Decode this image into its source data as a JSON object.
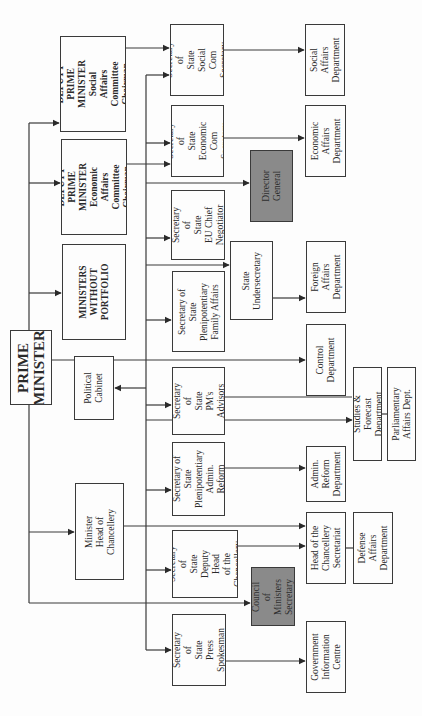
{
  "diagram": {
    "orientation": "rotated 90° counter-clockwise",
    "nodes": [
      {
        "id": "pm",
        "label": "PRIME\nMINISTER",
        "style": "bold-large",
        "box": [
          10,
          330,
          42,
          75
        ]
      },
      {
        "id": "dpm_social",
        "label": "DEPUTY PRIME\nMINISTER\nSocial Affairs\nCommittee\nChairman",
        "style": "bold",
        "box": [
          60,
          36,
          66,
          96
        ]
      },
      {
        "id": "dpm_econ",
        "label": "DEPUTY PRIME\nMINISTER\nEconomic Affairs\nCommittee\nChairman",
        "style": "bold",
        "box": [
          61,
          139,
          66,
          96
        ]
      },
      {
        "id": "mwp",
        "label": "MINISTERS\nWITHOUT\nPORTFOLIO",
        "style": "bold",
        "box": [
          62,
          244,
          64,
          96
        ]
      },
      {
        "id": "political_cabinet",
        "label": "Political\nCabinet",
        "style": "normal",
        "box": [
          74,
          356,
          40,
          64
        ]
      },
      {
        "id": "min_chancellery",
        "label": "Minister\nHead of Chancellery",
        "style": "normal",
        "box": [
          75,
          483,
          49,
          97
        ]
      },
      {
        "id": "sos_social",
        "label": "Secretary of\nState\nSocial Com\nSecretary",
        "style": "normal",
        "box": [
          170,
          24,
          54,
          72
        ]
      },
      {
        "id": "sos_econ",
        "label": "Secretary of\nState\nEconomic\nCom Secretary",
        "style": "normal",
        "box": [
          171,
          105,
          53,
          72
        ]
      },
      {
        "id": "sos_eu",
        "label": "Secretary of\nState\nEU Chief\nNegotiator",
        "style": "normal",
        "box": [
          171,
          190,
          54,
          70
        ]
      },
      {
        "id": "sos_family",
        "label": "Secretary of State\nPlenipotentiary\nFamily Affairs",
        "style": "normal",
        "box": [
          172,
          271,
          53,
          81
        ]
      },
      {
        "id": "sos_pm_advisors",
        "label": "Secretary of\nState\nPM's\nAdvisors",
        "style": "normal",
        "box": [
          172,
          367,
          53,
          68
        ]
      },
      {
        "id": "sos_admin",
        "label": "Secretary of\nState\nPlenipotentiary\nAdmin. Reform",
        "style": "normal",
        "box": [
          172,
          442,
          53,
          74
        ]
      },
      {
        "id": "sos_deputy_head",
        "label": "Secretary of\nState\nDeputy Head\nof the\nChancellery",
        "style": "normal",
        "box": [
          172,
          530,
          66,
          68
        ]
      },
      {
        "id": "sos_press",
        "label": "Secretary of\nState\nPress\nSpokesman",
        "style": "normal",
        "box": [
          172,
          614,
          54,
          72
        ]
      },
      {
        "id": "director_general",
        "label": "Director\nGeneral",
        "style": "shaded",
        "box": [
          250,
          150,
          43,
          72
        ]
      },
      {
        "id": "state_undersecretary",
        "label": "State\nUndersecretary",
        "style": "normal",
        "box": [
          230,
          241,
          43,
          79
        ]
      },
      {
        "id": "council_secretary",
        "label": "Council of\nMinisters\nSecretary",
        "style": "shaded",
        "box": [
          251,
          567,
          44,
          59
        ]
      },
      {
        "id": "social_dept",
        "label": "Social Affairs\nDepartment",
        "style": "normal",
        "box": [
          305,
          24,
          40,
          72
        ]
      },
      {
        "id": "econ_dept",
        "label": "Economic\nAffairs\nDepartment",
        "style": "normal",
        "box": [
          305,
          105,
          41,
          72
        ]
      },
      {
        "id": "foreign_dept",
        "label": "Foreign\nAffairs\nDepartment",
        "style": "normal",
        "box": [
          306,
          241,
          40,
          72
        ]
      },
      {
        "id": "control_dept",
        "label": "Control\nDepartment",
        "style": "normal",
        "box": [
          306,
          324,
          40,
          72
        ]
      },
      {
        "id": "studies_dept",
        "label": "Studies & Forecast\nDepartment",
        "style": "normal",
        "box": [
          353,
          367,
          29,
          94
        ]
      },
      {
        "id": "parliamentary_dept",
        "label": "Parliamentary\nAffairs Dept.",
        "style": "normal",
        "box": [
          387,
          367,
          29,
          94
        ]
      },
      {
        "id": "admin_dept",
        "label": "Admin.\nReform\nDepartment",
        "style": "normal",
        "box": [
          306,
          446,
          40,
          56
        ]
      },
      {
        "id": "chancellery_secretariat",
        "label": "Head of the\nChancellery\nSecretariat",
        "style": "normal",
        "box": [
          306,
          512,
          40,
          72
        ]
      },
      {
        "id": "defense_dept",
        "label": "Defense\nAffairs\nDepartment",
        "style": "normal",
        "box": [
          353,
          512,
          40,
          72
        ]
      },
      {
        "id": "gov_info_centre",
        "label": "Government\nInformation\nCentre",
        "style": "normal",
        "box": [
          306,
          621,
          40,
          72
        ]
      }
    ],
    "edges": [
      [
        "pm",
        "dpm_social"
      ],
      [
        "pm",
        "dpm_econ"
      ],
      [
        "pm",
        "mwp"
      ],
      [
        "pm",
        "min_chancellery"
      ],
      [
        "pm",
        "council_secretary"
      ],
      [
        "dpm_social",
        "sos_social"
      ],
      [
        "dpm_econ",
        "sos_econ"
      ],
      [
        "pm",
        "sos_social"
      ],
      [
        "pm",
        "sos_econ"
      ],
      [
        "pm",
        "director_general"
      ],
      [
        "pm",
        "sos_eu"
      ],
      [
        "pm",
        "state_undersecretary"
      ],
      [
        "pm",
        "sos_family"
      ],
      [
        "pm",
        "political_cabinet"
      ],
      [
        "pm",
        "control_dept"
      ],
      [
        "pm",
        "sos_pm_advisors"
      ],
      [
        "pm",
        "studies_dept"
      ],
      [
        "pm",
        "sos_admin"
      ],
      [
        "pm",
        "sos_deputy_head"
      ],
      [
        "pm",
        "sos_press"
      ],
      [
        "min_chancellery",
        "chancellery_secretariat"
      ],
      [
        "sos_social",
        "social_dept"
      ],
      [
        "sos_econ",
        "econ_dept"
      ],
      [
        "state_undersecretary",
        "foreign_dept"
      ],
      [
        "sos_admin",
        "admin_dept"
      ],
      [
        "sos_deputy_head",
        "chancellery_secretariat"
      ],
      [
        "sos_press",
        "gov_info_centre"
      ],
      [
        "studies_dept",
        "parliamentary_dept"
      ],
      [
        "chancellery_secretariat",
        "defense_dept"
      ]
    ]
  }
}
